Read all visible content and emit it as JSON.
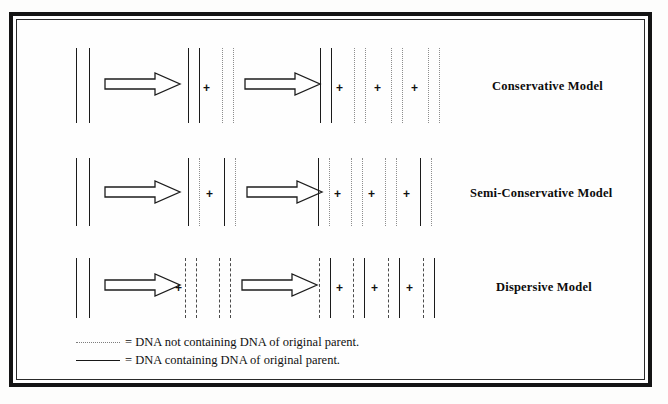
{
  "figure": {
    "background_color": "#ffffff",
    "frame_color": "#141414",
    "solid_strand_color": "#1b1b1b",
    "dotted_strand_color": "#8d8d8d",
    "dashdot_strand_color": "#4a4a4a"
  },
  "symbols": {
    "plus": "+",
    "arrow": "replication-arrow"
  },
  "rows": [
    {
      "id": "conservative",
      "label": "Conservative Model",
      "generations": [
        {
          "name": "parent",
          "duplexes": [
            {
              "strands": [
                "solid",
                "solid"
              ]
            }
          ]
        },
        {
          "name": "first-generation",
          "duplexes": [
            {
              "strands": [
                "solid",
                "solid"
              ]
            },
            {
              "strands": [
                "dotted",
                "dotted"
              ]
            }
          ]
        },
        {
          "name": "second-generation",
          "duplexes": [
            {
              "strands": [
                "solid",
                "solid"
              ]
            },
            {
              "strands": [
                "dotted",
                "dotted"
              ]
            },
            {
              "strands": [
                "dotted",
                "dotted"
              ]
            },
            {
              "strands": [
                "dotted",
                "dotted"
              ]
            }
          ]
        }
      ]
    },
    {
      "id": "semi-conservative",
      "label": "Semi-Conservative Model",
      "generations": [
        {
          "name": "parent",
          "duplexes": [
            {
              "strands": [
                "solid",
                "solid"
              ]
            }
          ]
        },
        {
          "name": "first-generation",
          "duplexes": [
            {
              "strands": [
                "solid",
                "dotted"
              ]
            },
            {
              "strands": [
                "solid",
                "dotted"
              ]
            }
          ]
        },
        {
          "name": "second-generation",
          "duplexes": [
            {
              "strands": [
                "solid",
                "dotted"
              ]
            },
            {
              "strands": [
                "dotted",
                "dotted"
              ]
            },
            {
              "strands": [
                "dotted",
                "dotted"
              ]
            },
            {
              "strands": [
                "dotted",
                "solid"
              ]
            }
          ]
        }
      ]
    },
    {
      "id": "dispersive",
      "label": "Dispersive Model",
      "generations": [
        {
          "name": "parent",
          "duplexes": [
            {
              "strands": [
                "solid",
                "solid"
              ]
            }
          ]
        },
        {
          "name": "first-generation",
          "duplexes": [
            {
              "strands": [
                "dashdot",
                "dashdot"
              ]
            },
            {
              "strands": [
                "dashdot",
                "dashdot"
              ]
            }
          ]
        },
        {
          "name": "second-generation",
          "duplexes": [
            {
              "strands": [
                "dashdot",
                "solid"
              ]
            },
            {
              "strands": [
                "dashdot",
                "solid"
              ]
            },
            {
              "strands": [
                "dashdot",
                "solid"
              ]
            },
            {
              "strands": [
                "dashdot",
                "solid"
              ]
            }
          ]
        }
      ]
    }
  ],
  "legend": {
    "items": [
      {
        "style": "dotted",
        "text": "= DNA not containing DNA of original parent."
      },
      {
        "style": "solid",
        "text": "= DNA containing DNA of original parent."
      }
    ]
  }
}
